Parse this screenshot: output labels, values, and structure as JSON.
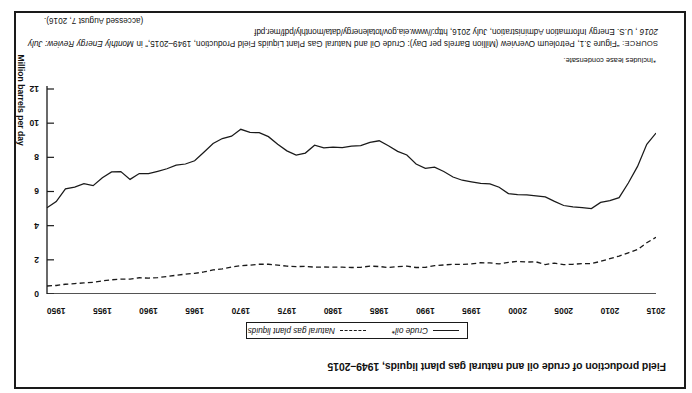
{
  "figure": {
    "title": "Field production of crude oil and natural gas plant liquids, 1949–2015",
    "footnote": "*Includes lease condensate.",
    "source_label": "SOURCE:",
    "source_text_1": "“Figure 3.1, Petroleum Overview (Million Barrels per Day): Crude Oil and Natural Gas Plant Liquids Field Production, 1949–2015,” in ",
    "source_italic_1": "Monthly Energy Review: July 2016",
    "source_text_2": ", U.S. Energy Information Administration, July 2016, ",
    "source_url": "http://www.eia.gov/totalenergy/data/monthly/pdf/mer.pdf",
    "accessed": "(accessed August 7, 2016)."
  },
  "legend": {
    "items": [
      {
        "label": "Crude oil*",
        "style": "solid",
        "icon": "solid-line-icon"
      },
      {
        "label": "Natural gas plant liquids",
        "style": "dashed",
        "icon": "dashed-line-icon"
      }
    ]
  },
  "chart_data": {
    "type": "line",
    "title": "Field production of crude oil and natural gas plant liquids, 1949–2015",
    "xlabel": "",
    "ylabel": "Million barrels per day",
    "xlim": [
      1949,
      2015
    ],
    "ylim": [
      0,
      12
    ],
    "grid": false,
    "legend_position": "bottom-center",
    "xticks": [
      1950,
      1955,
      1960,
      1965,
      1970,
      1975,
      1980,
      1985,
      1990,
      1995,
      2000,
      2005,
      2010,
      2015
    ],
    "xtick_labels": [
      "1950",
      "1955",
      "1960",
      "1965",
      "1970",
      "1975",
      "1980",
      "1985",
      "1990",
      "1995",
      "2000",
      "2005",
      "2010",
      "2015"
    ],
    "yticks": [
      0,
      2,
      4,
      6,
      8,
      10,
      12
    ],
    "ytick_labels": [
      "0",
      "2",
      "4",
      "6",
      "8",
      "10",
      "12"
    ],
    "x": [
      1949,
      1950,
      1951,
      1952,
      1953,
      1954,
      1955,
      1956,
      1957,
      1958,
      1959,
      1960,
      1961,
      1962,
      1963,
      1964,
      1965,
      1966,
      1967,
      1968,
      1969,
      1970,
      1971,
      1972,
      1973,
      1974,
      1975,
      1976,
      1977,
      1978,
      1979,
      1980,
      1981,
      1982,
      1983,
      1984,
      1985,
      1986,
      1987,
      1988,
      1989,
      1990,
      1991,
      1992,
      1993,
      1994,
      1995,
      1996,
      1997,
      1998,
      1999,
      2000,
      2001,
      2002,
      2003,
      2004,
      2005,
      2006,
      2007,
      2008,
      2009,
      2010,
      2011,
      2012,
      2013,
      2014,
      2015
    ],
    "series": [
      {
        "name": "Crude oil*",
        "style": "solid",
        "values": [
          5.05,
          5.41,
          6.16,
          6.26,
          6.46,
          6.34,
          6.81,
          7.15,
          7.17,
          6.71,
          7.05,
          7.04,
          7.18,
          7.33,
          7.54,
          7.61,
          7.8,
          8.3,
          8.81,
          9.1,
          9.24,
          9.64,
          9.46,
          9.44,
          9.21,
          8.77,
          8.38,
          8.13,
          8.25,
          8.71,
          8.55,
          8.6,
          8.57,
          8.65,
          8.69,
          8.88,
          8.97,
          8.68,
          8.35,
          8.14,
          7.61,
          7.36,
          7.42,
          7.17,
          6.85,
          6.66,
          6.56,
          6.47,
          6.45,
          6.25,
          5.88,
          5.82,
          5.8,
          5.75,
          5.68,
          5.42,
          5.18,
          5.1,
          5.06,
          5.0,
          5.36,
          5.47,
          5.64,
          6.5,
          7.47,
          8.76,
          9.42
        ]
      },
      {
        "name": "Natural gas plant liquids",
        "style": "dashed",
        "values": [
          0.47,
          0.5,
          0.57,
          0.61,
          0.65,
          0.68,
          0.77,
          0.83,
          0.87,
          0.87,
          0.95,
          0.93,
          0.96,
          1.02,
          1.1,
          1.16,
          1.21,
          1.29,
          1.41,
          1.47,
          1.58,
          1.66,
          1.69,
          1.74,
          1.74,
          1.69,
          1.63,
          1.6,
          1.62,
          1.57,
          1.58,
          1.57,
          1.57,
          1.55,
          1.56,
          1.63,
          1.61,
          1.55,
          1.6,
          1.63,
          1.55,
          1.56,
          1.66,
          1.7,
          1.74,
          1.73,
          1.76,
          1.83,
          1.82,
          1.76,
          1.85,
          1.91,
          1.87,
          1.88,
          1.72,
          1.81,
          1.72,
          1.74,
          1.78,
          1.78,
          1.91,
          2.07,
          2.22,
          2.41,
          2.6,
          3.0,
          3.32
        ]
      }
    ]
  }
}
